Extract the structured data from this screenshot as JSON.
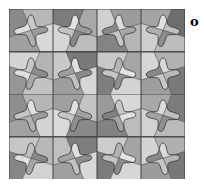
{
  "figure": {
    "label": "o",
    "rows": 4,
    "cols": 4,
    "tiles": [
      {
        "bg": [
          "#8a8a8a",
          "#b8b8b8",
          "#d8d8d8",
          "#a0a0a0"
        ],
        "star": [
          "#e0e0e0",
          "#c8c8c8",
          "#9a9a9a",
          "#b0b0b0"
        ],
        "flip": false
      },
      {
        "bg": [
          "#a8a8a8",
          "#7c7c7c",
          "#d6d6d6",
          "#bcbcbc"
        ],
        "star": [
          "#9a9a9a",
          "#e2e2e2",
          "#c4c4c4",
          "#888888"
        ],
        "flip": true
      },
      {
        "bg": [
          "#d0d0d0",
          "#9c9c9c",
          "#b6b6b6",
          "#848484"
        ],
        "star": [
          "#8a8a8a",
          "#dedede",
          "#a6a6a6",
          "#c8c8c8"
        ],
        "flip": false
      },
      {
        "bg": [
          "#6e6e6e",
          "#a4a4a4",
          "#cfcfcf",
          "#bdbdbd"
        ],
        "star": [
          "#c0c0c0",
          "#e0e0e0",
          "#b0b0b0",
          "#8c8c8c"
        ],
        "flip": true
      },
      {
        "bg": [
          "#b4b4b4",
          "#d4d4d4",
          "#969696",
          "#c2c2c2"
        ],
        "star": [
          "#8c8c8c",
          "#c6c6c6",
          "#e0e0e0",
          "#a8a8a8"
        ],
        "flip": true
      },
      {
        "bg": [
          "#c8c8c8",
          "#7a7a7a",
          "#d6d6d6",
          "#9e9e9e"
        ],
        "star": [
          "#9e9e9e",
          "#e0e0e0",
          "#8a8a8a",
          "#c2c2c2"
        ],
        "flip": false
      },
      {
        "bg": [
          "#a6a6a6",
          "#c8c8c8",
          "#7e7e7e",
          "#d4d4d4"
        ],
        "star": [
          "#e2e2e2",
          "#b4b4b4",
          "#c6c6c6",
          "#8e8e8e"
        ],
        "flip": true
      },
      {
        "bg": [
          "#d6d6d6",
          "#b2b2b2",
          "#7a7a7a",
          "#9e9e9e"
        ],
        "star": [
          "#888888",
          "#d8d8d8",
          "#b8b8b8",
          "#c8c8c8"
        ],
        "flip": false
      },
      {
        "bg": [
          "#8e8e8e",
          "#b6b6b6",
          "#d4d4d4",
          "#a2a2a2"
        ],
        "star": [
          "#c6c6c6",
          "#e0e0e0",
          "#9c9c9c",
          "#b2b2b2"
        ],
        "flip": false
      },
      {
        "bg": [
          "#c4c4c4",
          "#a0a0a0",
          "#dadada",
          "#8a8a8a"
        ],
        "star": [
          "#a2a2a2",
          "#e0e0e0",
          "#c8c8c8",
          "#8e8e8e"
        ],
        "flip": true
      },
      {
        "bg": [
          "#9a9a9a",
          "#d8d8d8",
          "#bcbcbc",
          "#828282"
        ],
        "star": [
          "#808080",
          "#c8c8c8",
          "#e2e2e2",
          "#a4a4a4"
        ],
        "flip": false
      },
      {
        "bg": [
          "#7c7c7c",
          "#a8a8a8",
          "#d2d2d2",
          "#bababa"
        ],
        "star": [
          "#c0c0c0",
          "#dcdcdc",
          "#a2a2a2",
          "#8e8e8e"
        ],
        "flip": true
      },
      {
        "bg": [
          "#b8b8b8",
          "#c6c6c6",
          "#868686",
          "#d2d2d2"
        ],
        "star": [
          "#888888",
          "#c0c0c0",
          "#e0e0e0",
          "#a6a6a6"
        ],
        "flip": true
      },
      {
        "bg": [
          "#c0c0c0",
          "#7e7e7e",
          "#d8d8d8",
          "#a0a0a0"
        ],
        "star": [
          "#a4a4a4",
          "#e0e0e0",
          "#8c8c8c",
          "#c4c4c4"
        ],
        "flip": false
      },
      {
        "bg": [
          "#a4a4a4",
          "#cccccc",
          "#7c7c7c",
          "#d6d6d6"
        ],
        "star": [
          "#e2e2e2",
          "#b2b2b2",
          "#c4c4c4",
          "#8a8a8a"
        ],
        "flip": true
      },
      {
        "bg": [
          "#d4d4d4",
          "#b0b0b0",
          "#787878",
          "#9c9c9c"
        ],
        "star": [
          "#888888",
          "#dadada",
          "#b6b6b6",
          "#c8c8c8"
        ],
        "flip": false
      }
    ]
  }
}
